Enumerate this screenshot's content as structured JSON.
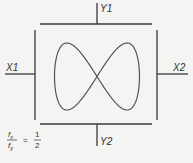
{
  "diagram": {
    "labels": {
      "y1": "Y1",
      "y2": "Y2",
      "x1": "X1",
      "x2": "X2"
    },
    "ratio": {
      "numerator": "f",
      "numerator_sub": "x",
      "denominator": "f",
      "denominator_sub": "y",
      "equals": "=",
      "value_numerator": "1",
      "value_denominator": "2"
    },
    "colors": {
      "line": "#3a3a3a",
      "curve": "#555555",
      "background": "#f4f4f2"
    }
  }
}
